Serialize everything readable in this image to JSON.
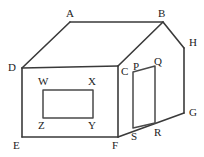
{
  "figure": {
    "type": "geometric-solid-diagram",
    "stroke_color": "#3a3a3a",
    "fill_color": "#ffffff",
    "label_color": "#1c1c1c",
    "width": 204,
    "height": 157
  },
  "vertices": [
    {
      "id": "A",
      "label": "A",
      "point": [
        70,
        22
      ],
      "label_pos": [
        66,
        8
      ]
    },
    {
      "id": "B",
      "label": "B",
      "point": [
        163,
        22
      ],
      "label_pos": [
        158,
        8
      ]
    },
    {
      "id": "H",
      "label": "H",
      "point": [
        184,
        48
      ],
      "label_pos": [
        189,
        37
      ]
    },
    {
      "id": "G",
      "label": "G",
      "point": [
        184,
        113
      ],
      "label_pos": [
        189,
        107
      ]
    },
    {
      "id": "D",
      "label": "D",
      "point": [
        22,
        68
      ],
      "label_pos": [
        8,
        62
      ]
    },
    {
      "id": "C",
      "label": "C",
      "point": [
        118,
        66
      ],
      "label_pos": [
        121,
        66
      ]
    },
    {
      "id": "E",
      "label": "E",
      "point": [
        22,
        137
      ],
      "label_pos": [
        13,
        140
      ]
    },
    {
      "id": "F",
      "label": "F",
      "point": [
        118,
        137
      ],
      "label_pos": [
        112,
        140
      ]
    },
    {
      "id": "P",
      "label": "P",
      "point": [
        133,
        72
      ],
      "label_pos": [
        133,
        61
      ]
    },
    {
      "id": "Q",
      "label": "Q",
      "point": [
        155,
        66
      ],
      "label_pos": [
        154,
        56
      ]
    },
    {
      "id": "S",
      "label": "S",
      "point": [
        133,
        128
      ],
      "label_pos": [
        131,
        131
      ]
    },
    {
      "id": "R",
      "label": "R",
      "point": [
        155,
        123
      ],
      "label_pos": [
        154,
        127
      ]
    },
    {
      "id": "W",
      "label": "W",
      "point": [
        43,
        90
      ],
      "label_pos": [
        38,
        76
      ]
    },
    {
      "id": "X",
      "label": "X",
      "point": [
        93,
        90
      ],
      "label_pos": [
        88,
        76
      ]
    },
    {
      "id": "Y",
      "label": "Y",
      "point": [
        93,
        118
      ],
      "label_pos": [
        88,
        120
      ]
    },
    {
      "id": "Z",
      "label": "Z",
      "point": [
        43,
        118
      ],
      "label_pos": [
        38,
        120
      ]
    }
  ],
  "edges": {
    "roof_ridge": "A to B",
    "roof_left": "D to A",
    "roof_front_right": "B to C",
    "front_face": "D-C-F-E closed",
    "right_side": "B-H-G-R-S-F",
    "door": "P-Q-R-S closed",
    "window": "W-X-Y-Z closed"
  }
}
